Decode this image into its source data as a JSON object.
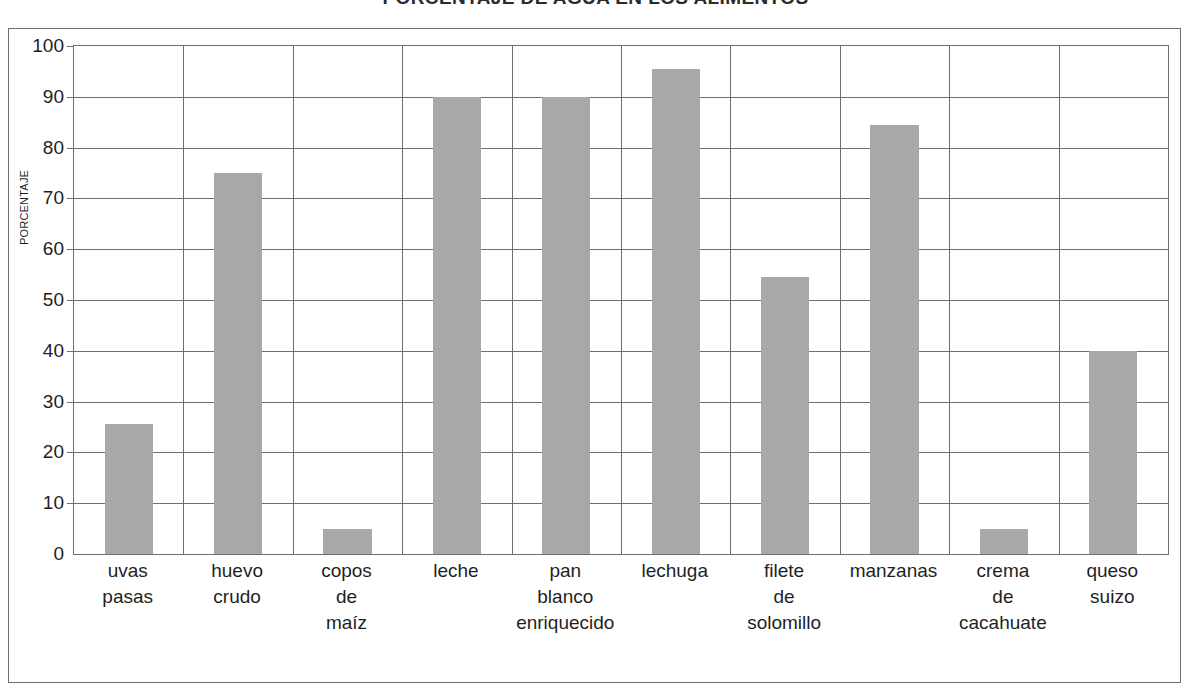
{
  "chart_data": {
    "type": "bar",
    "title": "PORCENTAJE DE AGUA EN LOS ALIMENTOS",
    "xlabel": "",
    "ylabel": "PORCENTAJE",
    "ylim": [
      0,
      100
    ],
    "ytick_step": 10,
    "yticks": [
      "0",
      "10",
      "20",
      "30",
      "40",
      "50",
      "60",
      "70",
      "80",
      "90",
      "100"
    ],
    "grid": true,
    "legend": null,
    "bar_color": "#a8a8a8",
    "axis_color": "#6e6e6e",
    "categories": [
      "uvas pasas",
      "huevo crudo",
      "copos de maíz",
      "leche",
      "pan blanco enriquecido",
      "lechuga",
      "filete de solomillo",
      "manzanas",
      "crema de cacahuate",
      "queso suizo"
    ],
    "category_lines": [
      [
        "uvas",
        "pasas"
      ],
      [
        "huevo",
        "crudo"
      ],
      [
        "copos",
        "de",
        "maíz"
      ],
      [
        "leche"
      ],
      [
        "pan",
        "blanco",
        "enriquecido"
      ],
      [
        "lechuga"
      ],
      [
        "filete",
        "de",
        "solomillo"
      ],
      [
        "manzanas"
      ],
      [
        "crema",
        "de",
        "cacahuate"
      ],
      [
        "queso",
        "suizo"
      ]
    ],
    "values": [
      25.5,
      75,
      5,
      90,
      90,
      95.5,
      54.5,
      84.5,
      5,
      40
    ]
  }
}
